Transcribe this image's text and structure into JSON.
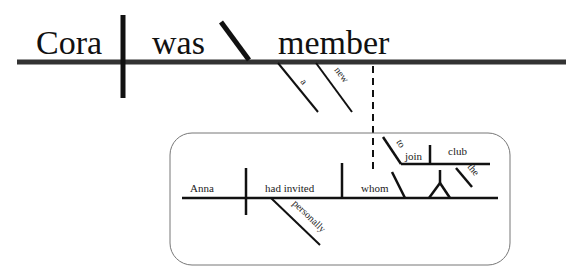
{
  "diagram": {
    "type": "sentence-diagram",
    "main_clause": {
      "subject": "Cora",
      "verb": "was",
      "predicate_noun": "member",
      "modifiers": [
        "a",
        "new"
      ]
    },
    "relative_clause": {
      "subject": "Anna",
      "verb": "had invited",
      "adverb": "personally",
      "object": "whom",
      "infinitive_marker": "to",
      "infinitive": "join",
      "infinitive_object": "club",
      "object_modifier": "the"
    }
  }
}
